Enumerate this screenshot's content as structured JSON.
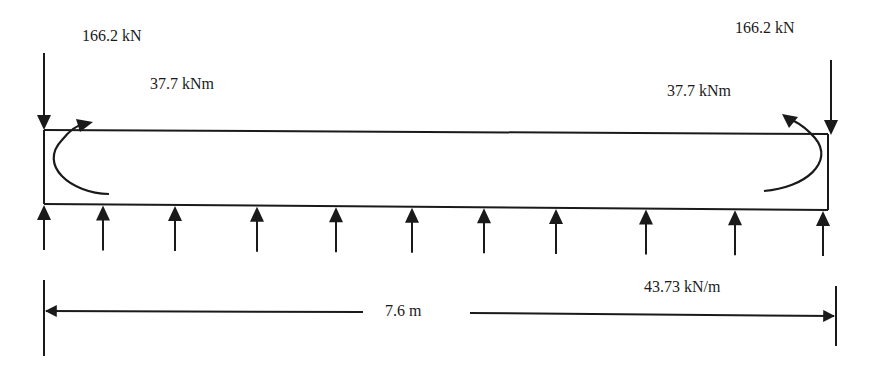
{
  "diagram": {
    "type": "beam-free-body",
    "colors": {
      "ink": "#1a1a1a",
      "background": "#ffffff"
    },
    "beam": {
      "x1": 44,
      "x2": 828,
      "top_left": 130,
      "top_right": 134,
      "bottom_left": 204,
      "bottom_right": 210
    },
    "point_loads": [
      {
        "id": "left",
        "label": "166.2 kN",
        "x": 44,
        "direction": "down"
      },
      {
        "id": "right",
        "label": "166.2 kN",
        "x": 831,
        "direction": "down"
      }
    ],
    "moments": [
      {
        "id": "left",
        "label": "37.7 kNm",
        "side": "left"
      },
      {
        "id": "right",
        "label": "37.7 kNm",
        "side": "right"
      }
    ],
    "distributed_load": {
      "label": "43.73 kN/m",
      "direction": "up",
      "arrow_x": [
        44,
        103,
        175,
        257,
        336,
        412,
        484,
        556,
        646,
        735,
        823
      ]
    },
    "dimension": {
      "label": "7.6 m",
      "x1": 44,
      "x2": 836,
      "y": 312
    }
  }
}
